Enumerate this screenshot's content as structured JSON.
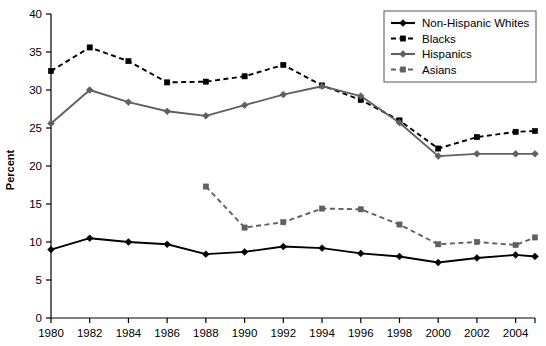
{
  "chart_data": {
    "type": "line",
    "title": "",
    "xlabel": "",
    "ylabel": "Percent",
    "xlim": [
      1980,
      2005
    ],
    "ylim": [
      0,
      40
    ],
    "ytick_step": 5,
    "xtick_step": 2,
    "grid": false,
    "legend_position": "top-right",
    "x_tick_labels": [
      "1980",
      "1982",
      "1984",
      "1986",
      "1988",
      "1990",
      "1992",
      "1994",
      "1996",
      "1998",
      "2000",
      "2002",
      "2004"
    ],
    "x_tick_values": [
      1980,
      1982,
      1984,
      1986,
      1988,
      1990,
      1992,
      1994,
      1996,
      1998,
      2000,
      2002,
      2004
    ],
    "y_tick_labels": [
      "0",
      "5",
      "10",
      "15",
      "20",
      "25",
      "30",
      "35",
      "40"
    ],
    "y_tick_values": [
      0,
      5,
      10,
      15,
      20,
      25,
      30,
      35,
      40
    ],
    "series": [
      {
        "name": "Non-Hispanic Whites",
        "color": "#000000",
        "dash": "solid",
        "marker": "diamond",
        "x": [
          1980,
          1982,
          1984,
          1986,
          1988,
          1990,
          1992,
          1994,
          1996,
          1998,
          2000,
          2002,
          2004,
          2005
        ],
        "values": [
          9.0,
          10.5,
          10.0,
          9.7,
          8.4,
          8.7,
          9.4,
          9.2,
          8.5,
          8.1,
          7.3,
          7.9,
          8.3,
          8.1
        ]
      },
      {
        "name": "Blacks",
        "color": "#000000",
        "dash": "dashed",
        "marker": "square",
        "x": [
          1980,
          1982,
          1984,
          1986,
          1988,
          1990,
          1992,
          1994,
          1996,
          1998,
          2000,
          2002,
          2004,
          2005
        ],
        "values": [
          32.5,
          35.6,
          33.8,
          31.0,
          31.1,
          31.8,
          33.3,
          30.6,
          28.7,
          26.0,
          22.3,
          23.8,
          24.5,
          24.6
        ]
      },
      {
        "name": "Hispanics",
        "color": "#606060",
        "dash": "solid",
        "marker": "diamond",
        "x": [
          1980,
          1982,
          1984,
          1986,
          1988,
          1990,
          1992,
          1994,
          1996,
          1998,
          2000,
          2002,
          2004,
          2005
        ],
        "values": [
          25.6,
          30.0,
          28.4,
          27.2,
          26.6,
          28.0,
          29.4,
          30.5,
          29.2,
          25.7,
          21.3,
          21.6,
          21.6,
          21.6
        ]
      },
      {
        "name": "Asians",
        "color": "#606060",
        "dash": "dashed",
        "marker": "square",
        "x": [
          1988,
          1990,
          1992,
          1994,
          1996,
          1998,
          2000,
          2002,
          2004,
          2005
        ],
        "values": [
          17.3,
          11.9,
          12.6,
          14.4,
          14.3,
          12.3,
          9.7,
          10.0,
          9.6,
          10.6
        ]
      }
    ]
  },
  "legend": {
    "items": [
      {
        "label": "Non-Hispanic Whites"
      },
      {
        "label": "Blacks"
      },
      {
        "label": "Hispanics"
      },
      {
        "label": "Asians"
      }
    ]
  },
  "axes": {
    "y_axis_title": "Percent"
  }
}
